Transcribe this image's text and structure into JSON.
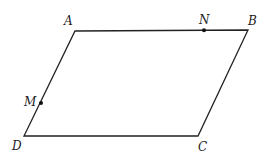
{
  "figure": {
    "type": "parallelogram",
    "vertices": [
      {
        "name": "A",
        "x": 75,
        "y": 31
      },
      {
        "name": "B",
        "x": 248,
        "y": 30
      },
      {
        "name": "C",
        "x": 198,
        "y": 136
      },
      {
        "name": "D",
        "x": 24,
        "y": 136
      }
    ],
    "points": [
      {
        "name": "N",
        "on": "AB",
        "x": 204,
        "y": 30
      },
      {
        "name": "M",
        "on": "AD",
        "x": 41,
        "y": 103
      }
    ],
    "labels": {
      "A": "A",
      "B": "B",
      "C": "C",
      "D": "D",
      "M": "M",
      "N": "N"
    },
    "stroke_color": "#222222"
  }
}
